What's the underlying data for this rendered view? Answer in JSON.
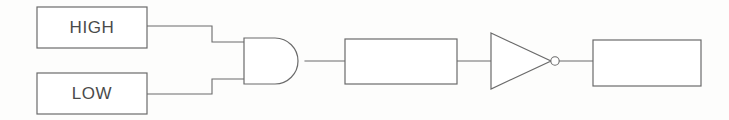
{
  "diagram": {
    "type": "digital-logic-schematic",
    "background_color": "#fdfdfc",
    "line_color": "#6b6b6b",
    "text_color": "#4a4a4a",
    "fill_color": "#ffffff"
  },
  "inputs": [
    {
      "id": "input-high",
      "label": "HIGH",
      "shape": "rectangle",
      "x": 37,
      "y": 7,
      "width": 110,
      "height": 41
    },
    {
      "id": "input-low",
      "label": "LOW",
      "shape": "rectangle",
      "x": 37,
      "y": 73,
      "width": 110,
      "height": 41
    }
  ],
  "gates": [
    {
      "id": "and-gate",
      "type": "AND",
      "icon": "and-gate-icon",
      "label": "",
      "inputs": 2,
      "x": 244,
      "y": 38,
      "width": 61,
      "height": 46
    },
    {
      "id": "not-gate",
      "type": "NOT",
      "icon": "not-gate-icon",
      "label": "",
      "inputs": 1,
      "inverting_bubble": true,
      "x": 491,
      "y": 33,
      "width": 68,
      "height": 56
    }
  ],
  "blocks": [
    {
      "id": "middle-block",
      "label": "",
      "shape": "rectangle",
      "x": 345,
      "y": 39,
      "width": 112,
      "height": 45
    },
    {
      "id": "output-block",
      "label": "",
      "shape": "rectangle",
      "x": 593,
      "y": 40,
      "width": 108,
      "height": 46
    }
  ],
  "wires": [
    {
      "id": "wire-high-to-and",
      "from": "input-high",
      "to": "and-gate",
      "path": "M147 26 L212 26 L212 42 L244 42"
    },
    {
      "id": "wire-low-to-and",
      "from": "input-low",
      "to": "and-gate",
      "path": "M147 94 L212 94 L212 79 L244 79"
    },
    {
      "id": "wire-and-to-middle",
      "from": "and-gate",
      "to": "middle-block",
      "path": "M305 61 L345 61"
    },
    {
      "id": "wire-middle-to-not",
      "from": "middle-block",
      "to": "not-gate",
      "path": "M457 61 L491 61"
    },
    {
      "id": "wire-not-to-output",
      "from": "not-gate",
      "to": "output-block",
      "path": "M559 61 L593 61"
    }
  ]
}
